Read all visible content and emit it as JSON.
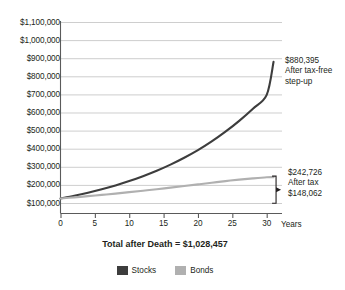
{
  "chart_data": {
    "type": "line",
    "title": "",
    "xlabel": "Years",
    "ylabel": "",
    "xlim": [
      0,
      31.5
    ],
    "ylim": [
      0,
      1100000
    ],
    "grid": true,
    "legend_position": "bottom-center",
    "x_ticks": [
      0,
      5,
      10,
      15,
      20,
      25,
      30
    ],
    "x_tick_labels": [
      "0",
      "5",
      "10",
      "15",
      "20",
      "25",
      "30"
    ],
    "y_ticks": [
      100000,
      200000,
      300000,
      400000,
      500000,
      600000,
      700000,
      800000,
      900000,
      1000000,
      1100000
    ],
    "y_tick_labels": [
      "$100,000",
      "$200,000",
      "$300,000",
      "$400,000",
      "$500,000",
      "$600,000",
      "$700,000",
      "$800,000",
      "$900,000",
      "$1,000,000",
      "$1,100,000"
    ],
    "x": [
      0,
      2,
      4,
      6,
      8,
      10,
      12,
      14,
      16,
      18,
      20,
      22,
      24,
      26,
      28,
      30,
      31
    ],
    "series": [
      {
        "name": "Stocks",
        "color": "#3d3d3d",
        "values": [
          125000,
          140000,
          157000,
          176000,
          197000,
          221000,
          248000,
          278000,
          312000,
          350000,
          392000,
          440000,
          494000,
          554000,
          621000,
          697000,
          880395
        ],
        "end_value": 880395,
        "end_label": "$880,395"
      },
      {
        "name": "Bonds",
        "color": "#b0b0b0",
        "values": [
          125000,
          131000,
          138000,
          145000,
          152000,
          160000,
          168000,
          176000,
          185000,
          194000,
          203000,
          212000,
          221000,
          229000,
          236000,
          242000,
          242726
        ],
        "end_value": 242726,
        "end_label": "$242,726"
      }
    ],
    "annotations": [
      {
        "id": "stocks-endpoint",
        "amount": "$880,395",
        "note_line_1": "After tax-free",
        "note_line_2": "step-up"
      },
      {
        "id": "bonds-endpoint",
        "amount": "$242,726",
        "note_line_1": "After tax",
        "note_line_2": "$148,062"
      }
    ],
    "caption": "Total after Death = $1,028,457"
  },
  "axes": {
    "x_title": "Years"
  },
  "legend": {
    "items": [
      {
        "label": "Stocks",
        "color": "#3d3d3d"
      },
      {
        "label": "Bonds",
        "color": "#b0b0b0"
      }
    ]
  }
}
